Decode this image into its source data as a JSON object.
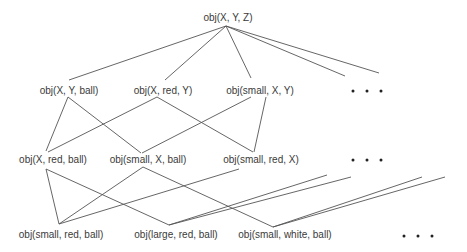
{
  "diagram": {
    "type": "generalization-lattice",
    "colors": {
      "line": "#555555",
      "text": "#3a3a3a",
      "dots": "#222222"
    },
    "nodes": {
      "root": {
        "label": "obj(X, Y, Z)",
        "x": 228,
        "y": 18
      },
      "n1a": {
        "label": "obj(X, Y, ball)",
        "x": 69,
        "y": 91
      },
      "n1b": {
        "label": "obj(X, red, Y)",
        "x": 163,
        "y": 91
      },
      "n1c": {
        "label": "obj(small, X, Y)",
        "x": 260,
        "y": 91
      },
      "n2a": {
        "label": "obj(X, red, ball)",
        "x": 53,
        "y": 160
      },
      "n2b": {
        "label": "obj(small, X, ball)",
        "x": 148,
        "y": 160
      },
      "n2c": {
        "label": "obj(small, red, X)",
        "x": 261,
        "y": 160
      },
      "n3a": {
        "label": "obj(small, red, ball)",
        "x": 61,
        "y": 235
      },
      "n3b": {
        "label": "obj(large, red, ball)",
        "x": 176,
        "y": 235
      },
      "n3c": {
        "label": "obj(small, white, ball)",
        "x": 285,
        "y": 235
      }
    },
    "ellipses": [
      {
        "label": "more-level-1",
        "x": 367,
        "y": 91
      },
      {
        "label": "more-level-2",
        "x": 367,
        "y": 160
      },
      {
        "label": "more-level-3",
        "x": 418,
        "y": 236
      }
    ],
    "edges": [
      {
        "from": "root",
        "to": "n1a",
        "x1": 226,
        "y1": 26,
        "x2": 69,
        "y2": 80
      },
      {
        "from": "root",
        "to": "n1b",
        "x1": 226,
        "y1": 26,
        "x2": 165,
        "y2": 80
      },
      {
        "from": "root",
        "to": "n1c",
        "x1": 226,
        "y1": 26,
        "x2": 251,
        "y2": 78
      },
      {
        "from": "root",
        "to": "more",
        "x1": 226,
        "y1": 26,
        "x2": 345,
        "y2": 76
      },
      {
        "from": "root",
        "to": "more",
        "x1": 226,
        "y1": 26,
        "x2": 379,
        "y2": 73
      },
      {
        "from": "n1a",
        "to": "n2a",
        "x1": 68,
        "y1": 97,
        "x2": 46,
        "y2": 151
      },
      {
        "from": "n1a",
        "to": "n2b",
        "x1": 68,
        "y1": 97,
        "x2": 141,
        "y2": 153
      },
      {
        "from": "n1b",
        "to": "n2a",
        "x1": 157,
        "y1": 97,
        "x2": 48,
        "y2": 152
      },
      {
        "from": "n1b",
        "to": "n2c",
        "x1": 157,
        "y1": 97,
        "x2": 253,
        "y2": 152
      },
      {
        "from": "n1c",
        "to": "n2b",
        "x1": 251,
        "y1": 97,
        "x2": 142,
        "y2": 153
      },
      {
        "from": "n1c",
        "to": "n2c",
        "x1": 266,
        "y1": 97,
        "x2": 254,
        "y2": 152
      },
      {
        "from": "n2a",
        "to": "n3a",
        "x1": 46,
        "y1": 169,
        "x2": 59,
        "y2": 224
      },
      {
        "from": "n2a",
        "to": "n3b",
        "x1": 46,
        "y1": 169,
        "x2": 169,
        "y2": 225
      },
      {
        "from": "n2b",
        "to": "n3a",
        "x1": 143,
        "y1": 167,
        "x2": 59,
        "y2": 224
      },
      {
        "from": "n2b",
        "to": "n3c",
        "x1": 143,
        "y1": 167,
        "x2": 273,
        "y2": 227
      },
      {
        "from": "n2c",
        "to": "n3a",
        "x1": 239,
        "y1": 169,
        "x2": 59,
        "y2": 224
      },
      {
        "from": "more",
        "to": "n3b",
        "x1": 327,
        "y1": 175,
        "x2": 169,
        "y2": 225
      },
      {
        "from": "more",
        "to": "n3b",
        "x1": 351,
        "y1": 177,
        "x2": 169,
        "y2": 225
      },
      {
        "from": "more",
        "to": "n3c",
        "x1": 422,
        "y1": 177,
        "x2": 273,
        "y2": 227
      },
      {
        "from": "more",
        "to": "n3c",
        "x1": 445,
        "y1": 177,
        "x2": 273,
        "y2": 227
      }
    ]
  }
}
